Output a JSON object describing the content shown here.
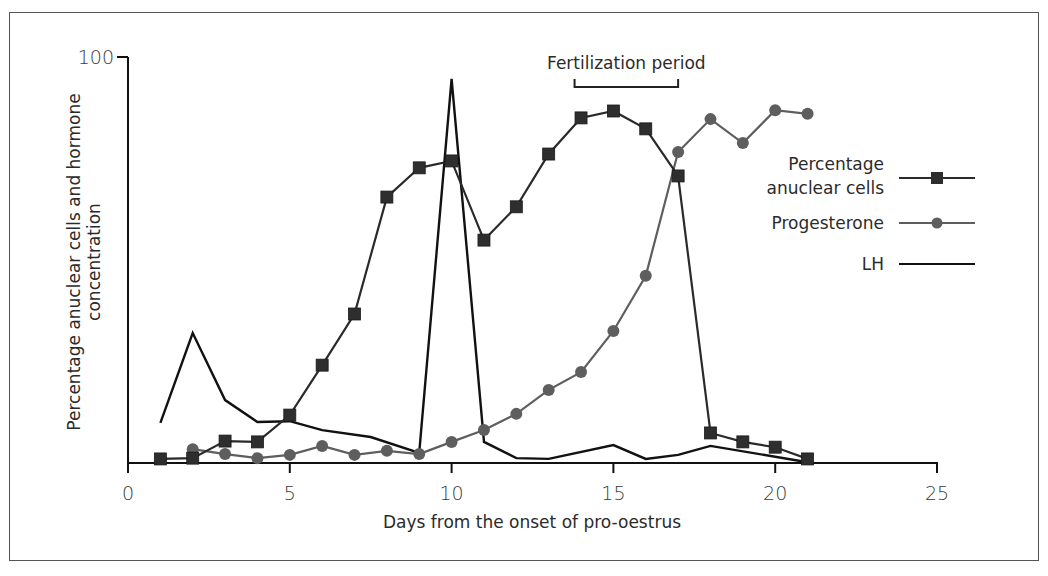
{
  "chart_data": {
    "type": "line",
    "title": "",
    "xlabel": "Days from the onset of pro-oestrus",
    "ylabel": "Percentage anuclear cells and hormone concentration",
    "ylabel_lines": [
      "Percentage anuclear cells and hormone",
      "concentration"
    ],
    "xlim": [
      0,
      25
    ],
    "ylim": [
      0,
      100
    ],
    "x_ticks": [
      0,
      5,
      10,
      15,
      20,
      25
    ],
    "y_ticks": [
      100
    ],
    "grid": false,
    "legend_position": "right",
    "annotations": [
      {
        "text": "Fertilization period",
        "x_start": 13.8,
        "x_end": 17,
        "type": "bracket"
      }
    ],
    "series": [
      {
        "name": "Percentage anuclear cells",
        "legend_lines": [
          "Percentage",
          "anuclear cells"
        ],
        "marker": "square",
        "color": "#2a2a2a",
        "x": [
          1,
          2,
          3,
          4,
          5,
          6,
          7,
          8,
          9,
          10,
          11,
          12,
          13,
          14,
          15,
          16,
          17,
          18,
          19,
          20,
          21
        ],
        "values": [
          1,
          1.2,
          5.4,
          5.2,
          11.8,
          24.1,
          36.7,
          65.5,
          72.7,
          74.4,
          54.9,
          63.1,
          76.1,
          85,
          86.7,
          82.3,
          70.7,
          7.4,
          5.2,
          3.9,
          1
        ]
      },
      {
        "name": "Progesterone",
        "legend_lines": [
          "Progesterone"
        ],
        "marker": "circle",
        "color": "#5e5e5e",
        "x": [
          2,
          3,
          4,
          5,
          6,
          7,
          8,
          9,
          10,
          11,
          12,
          13,
          14,
          15,
          16,
          17,
          18,
          19,
          20,
          21
        ],
        "values": [
          3.4,
          2.2,
          1.2,
          2,
          4.2,
          2,
          3,
          2.2,
          5.2,
          8.1,
          12.1,
          18,
          22.4,
          32.5,
          46.1,
          76.6,
          84.7,
          78.8,
          86.9,
          86
        ]
      },
      {
        "name": "LH",
        "legend_lines": [
          "LH"
        ],
        "marker": "none",
        "color": "#111111",
        "x": [
          1,
          2,
          3,
          4,
          5,
          6,
          7.5,
          9,
          10,
          11,
          12,
          13,
          15,
          16,
          17,
          18,
          21
        ],
        "values": [
          9.9,
          32,
          15.5,
          10.1,
          10.3,
          8.1,
          6.4,
          2.5,
          94.6,
          5.2,
          1.2,
          1,
          4.4,
          1,
          2,
          4.2,
          0.2
        ]
      }
    ]
  }
}
